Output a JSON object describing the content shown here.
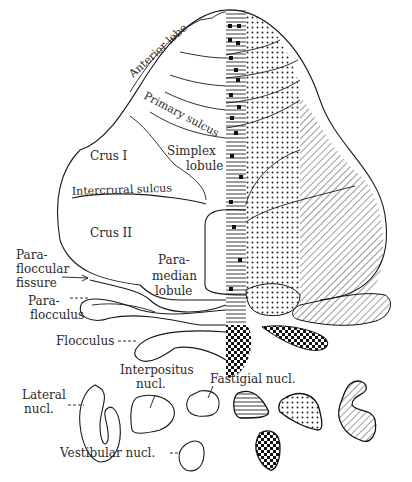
{
  "figure": {
    "labels": {
      "anterior_lobe": "Anterior lobe",
      "primary_sulcus": "Primary sulcus",
      "crus_1": "Crus I",
      "simplex_lobule_1": "Simplex",
      "simplex_lobule_2": "lobule",
      "intercrural_sulcus": "Intercrural sulcus",
      "crus_2": "Crus II",
      "paramedian_1": "Para-",
      "paramedian_2": "median",
      "paramedian_3": "lobule",
      "parafloccular_1": "Para-",
      "parafloccular_2": "floccular",
      "parafloccular_3": "fissure",
      "paraflocculus_1": "Para-",
      "paraflocculus_2": "flocculus",
      "flocculus": "Flocculus",
      "interpositus_1": "Interpositus",
      "interpositus_2": "nucl.",
      "fastigial": "Fastigial nucl.",
      "lateral_1": "Lateral",
      "lateral_2": "nucl.",
      "vestibular": "Vestibular nucl."
    },
    "zone_patterns": {
      "vermis": "horizontal-lines-with-black-squares",
      "paravermis_medial": "horizontal-lines",
      "paravermis": "dots",
      "lateral_hemisphere": "diagonal-hatch",
      "flocculonodular": "checkerboard"
    },
    "colors": {
      "ink": "#1a1a1a",
      "background": "#ffffff"
    }
  }
}
